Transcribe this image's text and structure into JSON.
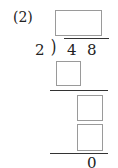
{
  "problem": {
    "label": "(2)",
    "divisor": "2",
    "dividend_digits": [
      "4",
      "8"
    ],
    "remainder": "0",
    "answer_boxes": [
      {
        "id": "quotient",
        "value": ""
      },
      {
        "id": "step1-product",
        "value": ""
      },
      {
        "id": "step2-bringdown",
        "value": ""
      },
      {
        "id": "step2-product",
        "value": ""
      }
    ]
  }
}
